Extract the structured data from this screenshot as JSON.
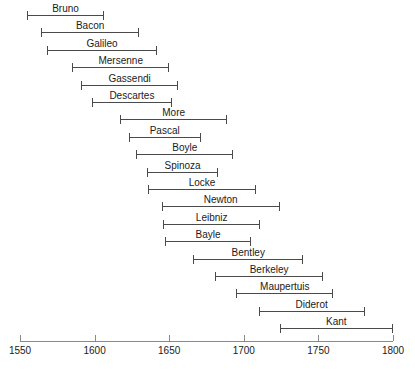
{
  "chart_data": {
    "type": "bar",
    "orientation": "horizontal",
    "subtype": "timeline-lifespan-ranges",
    "title": "",
    "subtitle": "",
    "xlabel": "",
    "ylabel": "",
    "xlim": [
      1550,
      1800
    ],
    "grid": false,
    "legend": null,
    "axis": {
      "ticks": [
        1550,
        1600,
        1650,
        1700,
        1750,
        1800
      ],
      "tick_labels": [
        "1550",
        "1600",
        "1650",
        "1700",
        "1750",
        "1800"
      ]
    },
    "categories": [
      "Bruno",
      "Bacon",
      "Galileo",
      "Mersenne",
      "Gassendi",
      "Descartes",
      "More",
      "Pascal",
      "Boyle",
      "Spinoza",
      "Locke",
      "Newton",
      "Leibniz",
      "Bayle",
      "Bentley",
      "Berkeley",
      "Maupertuis",
      "Diderot",
      "Kant"
    ],
    "bars": [
      {
        "label": "Bruno",
        "start": 1555,
        "end": 1606
      },
      {
        "label": "Bacon",
        "start": 1564,
        "end": 1630
      },
      {
        "label": "Galileo",
        "start": 1568,
        "end": 1642
      },
      {
        "label": "Mersenne",
        "start": 1585,
        "end": 1650
      },
      {
        "label": "Gassendi",
        "start": 1591,
        "end": 1656
      },
      {
        "label": "Descartes",
        "start": 1598,
        "end": 1652
      },
      {
        "label": "More",
        "start": 1617,
        "end": 1689
      },
      {
        "label": "Pascal",
        "start": 1623,
        "end": 1671
      },
      {
        "label": "Boyle",
        "start": 1628,
        "end": 1693
      },
      {
        "label": "Spinoza",
        "start": 1635,
        "end": 1683
      },
      {
        "label": "Locke",
        "start": 1636,
        "end": 1708
      },
      {
        "label": "Newton",
        "start": 1645,
        "end": 1724
      },
      {
        "label": "Leibniz",
        "start": 1646,
        "end": 1711
      },
      {
        "label": "Bayle",
        "start": 1647,
        "end": 1705
      },
      {
        "label": "Bentley",
        "start": 1666,
        "end": 1740
      },
      {
        "label": "Berkeley",
        "start": 1681,
        "end": 1753
      },
      {
        "label": "Maupertuis",
        "start": 1695,
        "end": 1760
      },
      {
        "label": "Diderot",
        "start": 1710,
        "end": 1781
      },
      {
        "label": "Kant",
        "start": 1724,
        "end": 1800
      }
    ],
    "colors": {
      "bar": "#4a4a4a",
      "axis": "#8a8a8a",
      "text": "#1a1a1a",
      "background": "#ffffff"
    }
  }
}
